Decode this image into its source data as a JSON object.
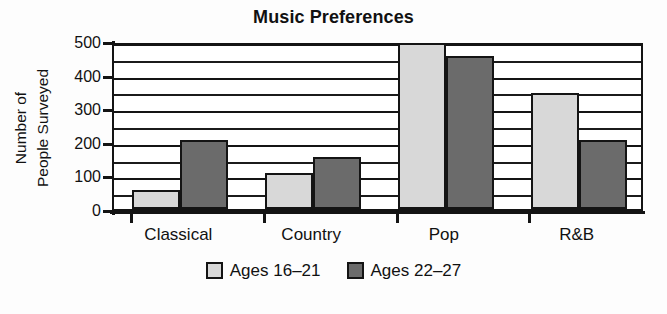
{
  "chart_data": {
    "type": "bar",
    "title": "Music Preferences",
    "xlabel": "",
    "ylabel_lines": [
      "Number of",
      "People Surveyed"
    ],
    "ylabel": "Number of People Surveyed",
    "categories": [
      "Classical",
      "Country",
      "Pop",
      "R&B"
    ],
    "series": [
      {
        "name": "Ages 16–21",
        "color": "#d8d8d8",
        "values": [
          50,
          100,
          500,
          340
        ]
      },
      {
        "name": "Ages 22–27",
        "color": "#6b6b6b",
        "values": [
          200,
          150,
          450,
          200
        ]
      }
    ],
    "ylim": [
      0,
      500
    ],
    "yticks": [
      0,
      100,
      200,
      300,
      400,
      500
    ],
    "ytick_labels": [
      "0",
      "100",
      "200",
      "300",
      "400",
      "500"
    ],
    "gridlines": {
      "visible": true,
      "orientation": "horizontal",
      "major_step": 100,
      "minor_step": 50,
      "values": [
        50,
        100,
        150,
        200,
        250,
        300,
        350,
        400,
        450,
        500
      ]
    },
    "legend": {
      "position": "bottom-center",
      "entries": [
        "Ages 16–21",
        "Ages 22–27"
      ]
    },
    "grouping": "grouped",
    "bar_outline_color": "#141414",
    "plot_background": "#ffffff"
  },
  "figure": {
    "background": "#fdfdfd",
    "text_color": "#111111"
  }
}
